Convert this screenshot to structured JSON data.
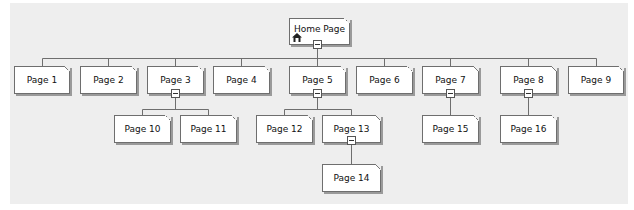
{
  "sitemap": {
    "root": {
      "label": "Home Page",
      "icon": "home-icon",
      "expanded": true
    },
    "pages": [
      {
        "id": "p1",
        "label": "Page 1"
      },
      {
        "id": "p2",
        "label": "Page 2"
      },
      {
        "id": "p3",
        "label": "Page 3",
        "expanded": true
      },
      {
        "id": "p4",
        "label": "Page 4"
      },
      {
        "id": "p5",
        "label": "Page 5",
        "expanded": true
      },
      {
        "id": "p6",
        "label": "Page 6"
      },
      {
        "id": "p7",
        "label": "Page 7",
        "expanded": true
      },
      {
        "id": "p8",
        "label": "Page 8",
        "expanded": true
      },
      {
        "id": "p9",
        "label": "Page 9"
      },
      {
        "id": "p10",
        "label": "Page 10",
        "parent": "Page 3"
      },
      {
        "id": "p11",
        "label": "Page 11",
        "parent": "Page 3"
      },
      {
        "id": "p12",
        "label": "Page 12",
        "parent": "Page 5"
      },
      {
        "id": "p13",
        "label": "Page 13",
        "parent": "Page 5",
        "expanded": true
      },
      {
        "id": "p14",
        "label": "Page 14",
        "parent": "Page 13"
      },
      {
        "id": "p15",
        "label": "Page 15",
        "parent": "Page 7"
      },
      {
        "id": "p16",
        "label": "Page 16",
        "parent": "Page 8"
      }
    ]
  },
  "colors": {
    "canvas": "#eeeeee",
    "node_fill": "#ffffff",
    "connector": "#6e6e6e"
  }
}
